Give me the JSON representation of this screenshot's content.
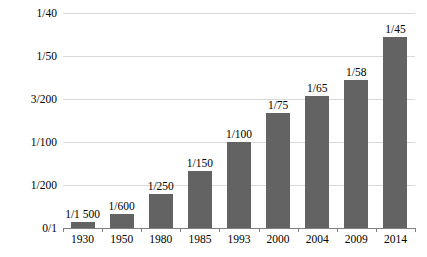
{
  "chart_data": {
    "type": "bar",
    "title": "",
    "subtitle": "",
    "xlabel": "",
    "ylabel": "",
    "grid": true,
    "legend": "none",
    "categories": [
      "1930",
      "1950",
      "1980",
      "1985",
      "1993",
      "2000",
      "2004",
      "2009",
      "2014"
    ],
    "data_labels": [
      "1/1 500",
      "1/600",
      "1/250",
      "1/150",
      "1/100",
      "1/75",
      "1/65",
      "1/58",
      "1/45"
    ],
    "values": [
      0.000667,
      0.001667,
      0.004,
      0.006667,
      0.01,
      0.013333,
      0.015385,
      0.017241,
      0.022222
    ],
    "ylim": [
      0,
      0.025
    ],
    "ytick_labels": [
      "0/1",
      "1/200",
      "1/100",
      "3/200",
      "1/50",
      "1/40"
    ],
    "ytick_values": [
      0,
      0.005,
      0.01,
      0.015,
      0.02,
      0.025
    ],
    "series": [
      {
        "name": "",
        "values": [
          0.000667,
          0.001667,
          0.004,
          0.006667,
          0.01,
          0.013333,
          0.015385,
          0.017241,
          0.022222
        ]
      }
    ],
    "bar_color": "#636363",
    "gridline_color": "#d9d9d9",
    "axis_color": "#808080"
  }
}
